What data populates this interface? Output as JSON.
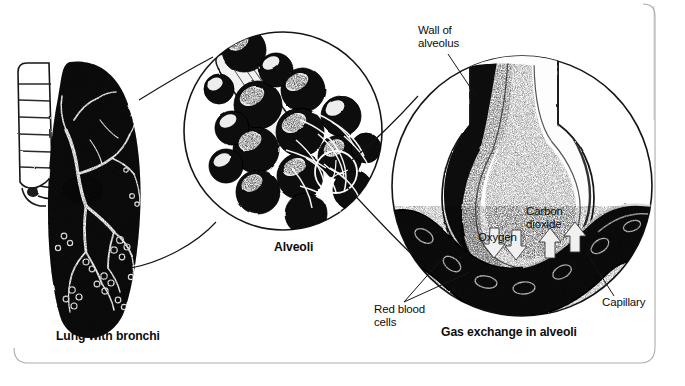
{
  "figure": {
    "title_visible": false,
    "background_color": "#ffffff",
    "ink_color": "#0d0d0d",
    "frame": {
      "name": "rounded-border-frame",
      "style": "hand-drawn rounded rectangle, faint gray",
      "color": "#9a9a9a"
    }
  },
  "panels": [
    {
      "id": "lung",
      "caption": "Lung with bronchi",
      "description": "Black silhouette of a lung with white branching bronchial tree and a segmented trachea/bronchus tube at upper left"
    },
    {
      "id": "alveoli",
      "caption": "Alveoli",
      "description": "Magnified cluster of grape-like alveolar sacs at the end of a bronchiole, enclosed in a circle"
    },
    {
      "id": "gas-exchange",
      "caption": "Gas exchange in alveoli",
      "description": "Magnified single alveolus with a capillary crossing beneath it, enclosed in a circle"
    }
  ],
  "callouts": [
    {
      "id": "wall-of-alveolus",
      "text": "Wall of\nalveolus",
      "bold": false
    },
    {
      "id": "carbon-dioxide",
      "text": "Carbon\ndioxide",
      "bold": false
    },
    {
      "id": "oxygen",
      "text": "Oxygen",
      "bold": false
    },
    {
      "id": "red-blood-cells",
      "text": "Red blood\ncells",
      "bold": false
    },
    {
      "id": "capillary",
      "text": "Capillary",
      "bold": false
    }
  ],
  "labels": {
    "lung_with_bronchi": "Lung with bronchi",
    "alveoli": "Alveoli",
    "gas_exchange_in_alveoli": "Gas exchange in alveoli",
    "wall_of_alveolus": "Wall of\nalveolus",
    "carbon_dioxide": "Carbon\ndioxide",
    "oxygen": "Oxygen",
    "red_blood_cells": "Red blood\ncells",
    "capillary": "Capillary"
  }
}
